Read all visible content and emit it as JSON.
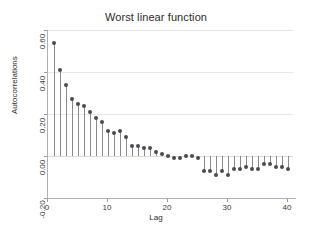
{
  "chart_data": {
    "type": "bar",
    "title": "Worst linear function",
    "xlabel": "Lag",
    "ylabel": "Autocorrelations",
    "xlim": [
      0,
      41
    ],
    "ylim": [
      -0.2,
      0.6
    ],
    "xticks": [
      0,
      10,
      20,
      30,
      40
    ],
    "xtick_labels": [
      "0",
      "10",
      "20",
      "30",
      "40"
    ],
    "yticks": [
      -0.2,
      0.0,
      0.2,
      0.4,
      0.6
    ],
    "ytick_labels": [
      "-0.20",
      "0.00",
      "0.20",
      "0.40",
      "0.60"
    ],
    "grid": true,
    "legend": null,
    "marker_color": "#4a4a52",
    "stem_color": "#8a8a8a",
    "background_color": "#ffffff",
    "categories": [
      1,
      2,
      3,
      4,
      5,
      6,
      7,
      8,
      9,
      10,
      11,
      12,
      13,
      14,
      15,
      16,
      17,
      18,
      19,
      20,
      21,
      22,
      23,
      24,
      25,
      26,
      27,
      28,
      29,
      30,
      31,
      32,
      33,
      34,
      35,
      36,
      37,
      38,
      39,
      40
    ],
    "values": [
      0.54,
      0.41,
      0.34,
      0.27,
      0.25,
      0.24,
      0.21,
      0.18,
      0.16,
      0.12,
      0.11,
      0.12,
      0.09,
      0.05,
      0.05,
      0.04,
      0.04,
      0.02,
      0.01,
      0.0,
      -0.01,
      -0.01,
      0.0,
      0.0,
      -0.01,
      -0.07,
      -0.07,
      -0.09,
      -0.07,
      -0.09,
      -0.06,
      -0.06,
      -0.05,
      -0.06,
      -0.06,
      -0.04,
      -0.04,
      -0.05,
      -0.05,
      -0.06
    ]
  }
}
